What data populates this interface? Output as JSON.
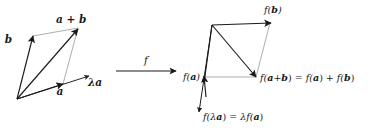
{
  "figure": {
    "type": "vector-space-linear-map-diagram",
    "background_color": "#ffffff",
    "stroke_color": "#1a1a1a",
    "thin_stroke_color": "#7d7d7d",
    "left_panel": {
      "name": "domain-parallelogram",
      "labels": {
        "a": "a",
        "b": "b",
        "a_plus_b": "a + b",
        "lambda_a": "λa"
      }
    },
    "map_arrow": {
      "label": "f"
    },
    "right_panel": {
      "name": "codomain-parallelogram",
      "labels": {
        "f_a": "f(a)",
        "f_b": "f(b)",
        "f_a_plus_b": "f(a+b) = f(a) + f(b)",
        "f_lambda_a": "f(λa) = λf(a)"
      }
    }
  }
}
